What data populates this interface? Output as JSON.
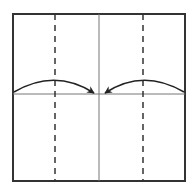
{
  "diagram": {
    "type": "origami-fold-instruction",
    "colors": {
      "background": "#ffffff",
      "outline": "#333333",
      "crease": "#777777",
      "arrow": "#222222"
    },
    "square": {
      "x": 13,
      "y": 14,
      "size": 172,
      "height": 167
    },
    "center_line_x": 99,
    "horizontal_line_y": 94,
    "dashed_lines_x": [
      55,
      143
    ],
    "arrows": [
      {
        "name": "left-arrow",
        "from": [
          13,
          94
        ],
        "to": [
          95,
          94
        ],
        "direction": "right"
      },
      {
        "name": "right-arrow",
        "from": [
          185,
          94
        ],
        "to": [
          104,
          94
        ],
        "direction": "left"
      }
    ],
    "caption": ""
  }
}
